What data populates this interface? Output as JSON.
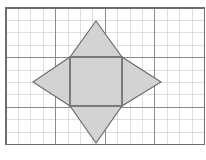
{
  "figure": {
    "partial_glyph_top": "g",
    "colors": {
      "page_background": "#ffffff",
      "grid_minor_line": "#c9c9c9",
      "grid_major_line": "#8c8c8c",
      "grid_border": "#6e6e6e",
      "shape_fill": "#d3d3d3",
      "shape_stroke": "#6b6b6b",
      "inner_square_stroke": "#7a7a7a"
    },
    "grid": {
      "origin_x": 6,
      "origin_y": 8,
      "cell_size": 12.4,
      "columns": 16,
      "rows": 11,
      "major_every": 4,
      "minor_line_width": 0.6,
      "major_line_width": 1.1,
      "border_line_width": 1.4
    },
    "star": {
      "label": "four-pointed-star",
      "points": [
        {
          "name": "top-point",
          "x": 96,
          "y": 21
        },
        {
          "name": "top-right-notch",
          "x": 122,
          "y": 57
        },
        {
          "name": "right-point",
          "x": 161,
          "y": 82
        },
        {
          "name": "bottom-right-notch",
          "x": 122,
          "y": 106
        },
        {
          "name": "bottom-point",
          "x": 96,
          "y": 143
        },
        {
          "name": "bottom-left-notch",
          "x": 70,
          "y": 106
        },
        {
          "name": "left-point",
          "x": 33,
          "y": 82
        },
        {
          "name": "top-left-notch",
          "x": 70,
          "y": 57
        }
      ]
    },
    "inner_square": {
      "label": "inner-square",
      "x": 70,
      "y": 57,
      "width": 52,
      "height": 49
    }
  },
  "chart_data": {
    "type": "diagram",
    "grid_columns": 16,
    "grid_rows": 11,
    "shapes": [
      {
        "name": "four-pointed-star",
        "kind": "polygon",
        "fill": "#d3d3d3",
        "stroke": "#6b6b6b",
        "vertices_px": [
          [
            96,
            21
          ],
          [
            122,
            57
          ],
          [
            161,
            82
          ],
          [
            122,
            106
          ],
          [
            96,
            143
          ],
          [
            70,
            106
          ],
          [
            33,
            82
          ],
          [
            70,
            57
          ]
        ]
      },
      {
        "name": "inner-square",
        "kind": "rect",
        "fill": "none",
        "stroke": "#7a7a7a",
        "rect_px": [
          70,
          57,
          52,
          49
        ]
      }
    ]
  }
}
